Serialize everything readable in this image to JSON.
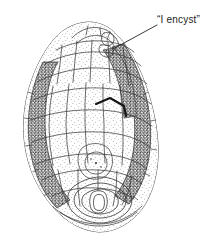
{
  "figure": {
    "kind": "scientific-line-drawing",
    "subject_description": "Ovoid stippled ink drawing of a specimen divided into polygonal cell-like facets, with dark stippled bands along both lateral margins and a nested oval structure at the base",
    "background_color": "#ffffff",
    "ink_color": "#1a1a1a",
    "stipple_light_color": "#6f6f6f",
    "stipple_dark_color": "#2b2b2b",
    "canvas": {
      "width": 209,
      "height": 247
    }
  },
  "annotations": [
    {
      "id": "encyst",
      "text": "“I encyst”",
      "leader_from": {
        "x": 157,
        "y": 25
      },
      "leader_to": {
        "x": 113,
        "y": 49
      }
    }
  ],
  "chart_data": {
    "type": "diagram",
    "title": "",
    "labels": [
      "“I encyst”"
    ],
    "annotation_count": 1
  }
}
